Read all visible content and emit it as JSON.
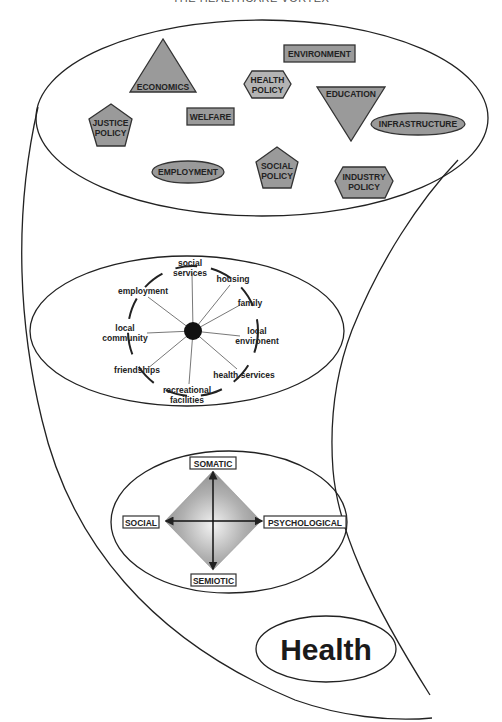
{
  "title": "THE HEALTHCARE VORTEX",
  "colors": {
    "line": "#222222",
    "shape_fill": "#9a9a9a",
    "shape_fill_light": "#b4b4b4",
    "background": "#ffffff"
  },
  "policy_layer": {
    "shapes": [
      {
        "id": "economics",
        "type": "triangle-up",
        "label": "ECONOMICS"
      },
      {
        "id": "environment",
        "type": "rectangle",
        "label": "ENVIRONMENT"
      },
      {
        "id": "health-policy",
        "type": "hexagon",
        "label_lines": [
          "HEALTH",
          "POLICY"
        ]
      },
      {
        "id": "education",
        "type": "triangle-down",
        "label": "EDUCATION"
      },
      {
        "id": "justice-policy",
        "type": "pentagon",
        "label_lines": [
          "JUSTICE",
          "POLICY"
        ]
      },
      {
        "id": "welfare",
        "type": "rectangle",
        "label": "WELFARE"
      },
      {
        "id": "infrastructure",
        "type": "ellipse",
        "label": "INFRASTRUCTURE"
      },
      {
        "id": "employment",
        "type": "ellipse",
        "label": "EMPLOYMENT"
      },
      {
        "id": "social-policy",
        "type": "pentagon",
        "label_lines": [
          "SOCIAL",
          "POLICY"
        ]
      },
      {
        "id": "industry-policy",
        "type": "hexagon",
        "label_lines": [
          "INDUSTRY",
          "POLICY"
        ]
      }
    ]
  },
  "community_layer": {
    "center": "individual",
    "spokes": [
      {
        "label_lines": [
          "social",
          "services"
        ]
      },
      {
        "label_lines": [
          "housing"
        ]
      },
      {
        "label_lines": [
          "family"
        ]
      },
      {
        "label_lines": [
          "local",
          "environent"
        ]
      },
      {
        "label_lines": [
          "health services"
        ]
      },
      {
        "label_lines": [
          "recreational",
          "facilities"
        ]
      },
      {
        "label_lines": [
          "friendships"
        ]
      },
      {
        "label_lines": [
          "local",
          "community"
        ]
      },
      {
        "label_lines": [
          "employment"
        ]
      }
    ]
  },
  "individual_layer": {
    "axes": {
      "top": "SOMATIC",
      "bottom": "SEMIOTIC",
      "left": "SOCIAL",
      "right": "PSYCHOLOGICAL"
    }
  },
  "outcome": {
    "label": "Health"
  }
}
